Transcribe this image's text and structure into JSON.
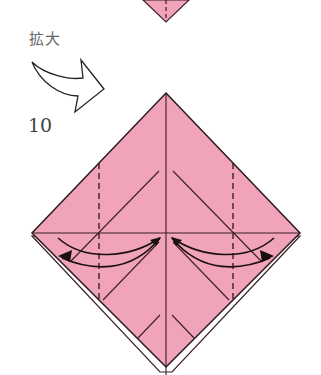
{
  "labels": {
    "zoom_text": "拡大",
    "step_number": "10"
  },
  "colors": {
    "paper": "#f0a3b9",
    "line": "#3a1f26",
    "background": "#ffffff"
  },
  "icons": {
    "enlarge_arrow": "curved-arrow-icon",
    "valley_fold_arrows": "double-curved-arrow-icon"
  }
}
